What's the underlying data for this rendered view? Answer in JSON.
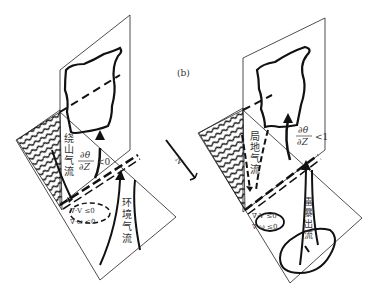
{
  "figure": {
    "panel_label": "(b)",
    "north_label": "N",
    "left_panel": {
      "labels": {
        "mountain_flow": [
          "绕",
          "山",
          "气",
          "流"
        ],
        "env_flow": [
          "环",
          "境",
          "气",
          "流"
        ],
        "stability_num": "∂θ",
        "stability_den": "∂Z",
        "stability_rel": "<0",
        "div1": "∇·V ≤0",
        "div2": "∇·ω ≤0"
      }
    },
    "right_panel": {
      "labels": {
        "local_flow": [
          "局",
          "地",
          "气",
          "流"
        ],
        "outflow": [
          "雷",
          "暴",
          "出",
          "流"
        ],
        "stability_num": "∂θ",
        "stability_den": "∂Z",
        "stability_rel": "<1",
        "div1": "∇·V ≤0",
        "div2": "∇·ω ≤0"
      }
    },
    "colors": {
      "stroke": "#111111",
      "text": "#333333",
      "background": "#ffffff"
    }
  }
}
